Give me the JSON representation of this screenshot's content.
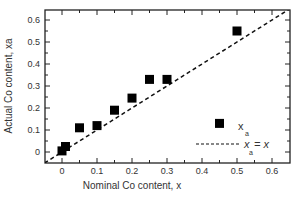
{
  "chart_data": {
    "type": "scatter",
    "title": "",
    "xlabel": "Nominal Co content, x",
    "ylabel": "Actual Co content, xa",
    "xlim": [
      -0.05,
      0.65
    ],
    "ylim": [
      -0.05,
      0.65
    ],
    "x_ticks": [
      "0",
      "0.1",
      "0.2",
      "0.3",
      "0.4",
      "0.5",
      "0.6"
    ],
    "y_ticks": [
      "0",
      "0.1",
      "0.2",
      "0.3",
      "0.4",
      "0.5",
      "0.6"
    ],
    "grid": false,
    "legend_position": "lower right",
    "series": [
      {
        "name": "x_a",
        "marker": "filled-square",
        "points": [
          {
            "x": 0.0,
            "y": 0.005
          },
          {
            "x": 0.01,
            "y": 0.025
          },
          {
            "x": 0.05,
            "y": 0.11
          },
          {
            "x": 0.1,
            "y": 0.12
          },
          {
            "x": 0.15,
            "y": 0.19
          },
          {
            "x": 0.2,
            "y": 0.245
          },
          {
            "x": 0.25,
            "y": 0.33
          },
          {
            "x": 0.3,
            "y": 0.33
          },
          {
            "x": 0.45,
            "y": 0.13
          },
          {
            "x": 0.5,
            "y": 0.55
          }
        ]
      },
      {
        "name": "x_a = x",
        "style": "dashed-line",
        "points": [
          {
            "x": -0.05,
            "y": -0.05
          },
          {
            "x": 0.65,
            "y": 0.65
          }
        ]
      }
    ]
  },
  "legend": {
    "marker_label": "x",
    "marker_sub": "a",
    "line_label_pre": "x",
    "line_label_sub": "a",
    "line_label_post": " = x"
  },
  "axes": {
    "xlabel": "Nominal Co content, x",
    "ylabel": "Actual Co content, xa"
  }
}
